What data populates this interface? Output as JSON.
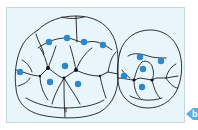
{
  "figure": {
    "type": "occlusal-contact-diagram",
    "background_color": "#e8f6fb",
    "border_color": "#c9d6da",
    "outline_color": "#1a1a1a",
    "dot_color": "#2f86c8",
    "teeth": [
      {
        "name": "molar",
        "contact_points": [
          {
            "x": 49,
            "y": 42
          },
          {
            "x": 67,
            "y": 38
          },
          {
            "x": 84,
            "y": 42
          },
          {
            "x": 103,
            "y": 45
          },
          {
            "x": 65,
            "y": 66
          },
          {
            "x": 20,
            "y": 72
          },
          {
            "x": 50,
            "y": 82
          },
          {
            "x": 78,
            "y": 84
          }
        ]
      },
      {
        "name": "premolar",
        "contact_points": [
          {
            "x": 140,
            "y": 57
          },
          {
            "x": 161,
            "y": 61
          },
          {
            "x": 143,
            "y": 69
          },
          {
            "x": 124,
            "y": 76
          },
          {
            "x": 142,
            "y": 87
          }
        ]
      }
    ]
  },
  "panel_tab": {
    "label": "b",
    "color": "#5aaee0"
  }
}
